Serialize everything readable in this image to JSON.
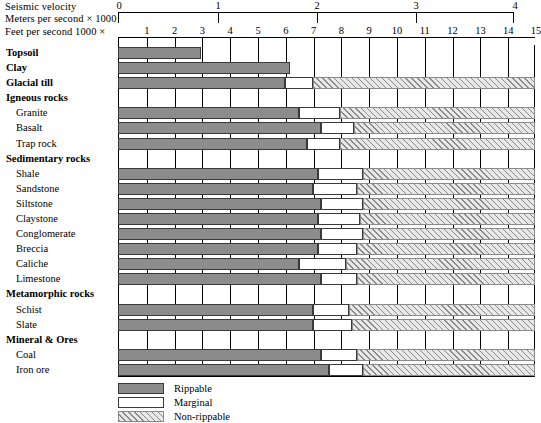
{
  "axes": {
    "seismic_velocity_label": "Seismic velocity",
    "metric_label": "Meters per second × 1000",
    "imperial_label": "Feet per second 1000 ×",
    "metric_ticks": [
      "0",
      "1",
      "2",
      "3",
      "4"
    ],
    "imperial_ticks": [
      "1",
      "2",
      "3",
      "4",
      "5",
      "6",
      "7",
      "8",
      "9",
      "10",
      "11",
      "12",
      "13",
      "14",
      "15"
    ]
  },
  "legend": {
    "items": [
      {
        "key": "rippable",
        "label": "Rippable"
      },
      {
        "key": "marginal",
        "label": "Marginal"
      },
      {
        "key": "nonrippable",
        "label": "Non-rippable"
      }
    ]
  },
  "colors": {
    "rippable": "#8c8c8c",
    "marginal": "#ffffff",
    "nonrippable": "#e8e8e8",
    "outline": "#000000"
  },
  "chart_data": {
    "type": "bar",
    "xlabel": "Feet per second 1000 ×",
    "ylabel": "",
    "xlim": [
      0,
      15
    ],
    "xlim_metric": [
      0,
      4.5
    ],
    "grid": true,
    "legend_position": "bottom-left",
    "stacked": true,
    "series": [
      {
        "name": "Rippable",
        "color": "#8c8c8c"
      },
      {
        "name": "Marginal",
        "color": "#ffffff"
      },
      {
        "name": "Non-rippable",
        "color": "#e8e8e8"
      }
    ],
    "categories": [
      "Topsoil",
      "Clay",
      "Glacial till",
      "Igneous rocks",
      "Granite",
      "Basalt",
      "Trap rock",
      "Sedimentary rocks",
      "Shale",
      "Sandstone",
      "Siltstone",
      "Claystone",
      "Conglomerate",
      "Breccia",
      "Caliche",
      "Limestone",
      "Metamorphic rocks",
      "Schist",
      "Slate",
      "Mineral & Ores",
      "Coal",
      "Iron ore"
    ],
    "rows": [
      {
        "label": "Topsoil",
        "type": "group",
        "rippable": 3.0,
        "marginal": null,
        "nonrippable": null
      },
      {
        "label": "Clay",
        "type": "group",
        "rippable": 6.2,
        "marginal": null,
        "nonrippable": null
      },
      {
        "label": "Glacial till",
        "type": "group",
        "rippable": 6.0,
        "marginal": 7.0,
        "nonrippable": 15.0
      },
      {
        "label": "Igneous rocks",
        "type": "group",
        "rippable": null,
        "marginal": null,
        "nonrippable": null
      },
      {
        "label": "Granite",
        "type": "item",
        "rippable": 6.5,
        "marginal": 8.0,
        "nonrippable": 15.0
      },
      {
        "label": "Basalt",
        "type": "item",
        "rippable": 7.3,
        "marginal": 8.5,
        "nonrippable": 15.0
      },
      {
        "label": "Trap rock",
        "type": "item",
        "rippable": 6.8,
        "marginal": 8.0,
        "nonrippable": 15.0
      },
      {
        "label": "Sedimentary rocks",
        "type": "group",
        "rippable": null,
        "marginal": null,
        "nonrippable": null
      },
      {
        "label": "Shale",
        "type": "item",
        "rippable": 7.2,
        "marginal": 8.8,
        "nonrippable": 15.0
      },
      {
        "label": "Sandstone",
        "type": "item",
        "rippable": 7.0,
        "marginal": 8.6,
        "nonrippable": 15.0
      },
      {
        "label": "Siltstone",
        "type": "item",
        "rippable": 7.3,
        "marginal": 8.8,
        "nonrippable": 15.0
      },
      {
        "label": "Claystone",
        "type": "item",
        "rippable": 7.2,
        "marginal": 8.7,
        "nonrippable": 15.0
      },
      {
        "label": "Conglomerate",
        "type": "item",
        "rippable": 7.3,
        "marginal": 8.8,
        "nonrippable": 15.0
      },
      {
        "label": "Breccia",
        "type": "item",
        "rippable": 7.2,
        "marginal": 8.6,
        "nonrippable": 15.0
      },
      {
        "label": "Caliche",
        "type": "item",
        "rippable": 6.5,
        "marginal": 8.2,
        "nonrippable": 15.0
      },
      {
        "label": "Limestone",
        "type": "item",
        "rippable": 7.3,
        "marginal": 8.6,
        "nonrippable": 15.0
      },
      {
        "label": "Metamorphic rocks",
        "type": "group",
        "rippable": null,
        "marginal": null,
        "nonrippable": null
      },
      {
        "label": "Schist",
        "type": "item",
        "rippable": 7.0,
        "marginal": 8.3,
        "nonrippable": 15.0
      },
      {
        "label": "Slate",
        "type": "item",
        "rippable": 7.0,
        "marginal": 8.4,
        "nonrippable": 15.0
      },
      {
        "label": "Mineral & Ores",
        "type": "group",
        "rippable": null,
        "marginal": null,
        "nonrippable": null
      },
      {
        "label": "Coal",
        "type": "item",
        "rippable": 7.3,
        "marginal": 8.6,
        "nonrippable": 15.0
      },
      {
        "label": "Iron ore",
        "type": "item",
        "rippable": 7.6,
        "marginal": 8.8,
        "nonrippable": 15.0
      }
    ]
  }
}
